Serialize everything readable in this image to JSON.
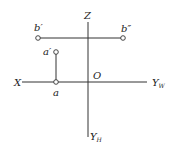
{
  "diagram": {
    "type": "orthographic-projection",
    "axes": {
      "z": {
        "label": "Z",
        "from": [
          88,
          22
        ],
        "to": [
          88,
          137
        ]
      },
      "x": {
        "label": "X",
        "from": [
          22,
          82
        ],
        "to": [
          147,
          82
        ]
      },
      "origin": {
        "label": "O",
        "at": [
          88,
          82
        ]
      },
      "yw": {
        "label": "Y",
        "sub": "W"
      },
      "yh": {
        "label": "Y",
        "sub": "H"
      }
    },
    "points": [
      {
        "id": "b-prime",
        "label": "b′",
        "at": [
          38,
          38
        ]
      },
      {
        "id": "b-double-prime",
        "label": "b″",
        "at": [
          123,
          38
        ]
      },
      {
        "id": "a-prime",
        "label": "a′",
        "at": [
          56,
          52
        ]
      },
      {
        "id": "a",
        "label": "a",
        "at": [
          56,
          82
        ]
      }
    ],
    "lines": [
      {
        "id": "b-projection-line",
        "from": [
          38,
          38
        ],
        "to": [
          123,
          38
        ]
      },
      {
        "id": "a-projection-line",
        "from": [
          56,
          52
        ],
        "to": [
          56,
          82
        ]
      }
    ]
  }
}
